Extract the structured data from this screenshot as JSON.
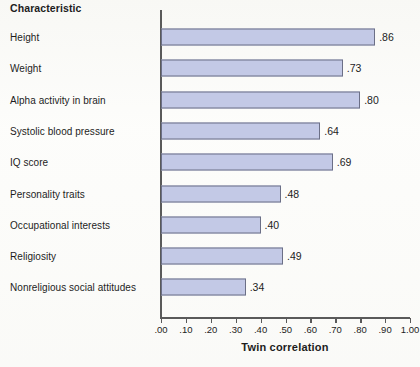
{
  "header": {
    "characteristic_label": "Characteristic"
  },
  "axis": {
    "x_title": "Twin correlation",
    "ticks": [
      ".00",
      ".10",
      ".20",
      ".30",
      ".40",
      ".50",
      ".60",
      ".70",
      ".80",
      ".90",
      "1.00"
    ]
  },
  "colors": {
    "bar_fill": "#c3c9e6",
    "bar_stroke": "#6b6f86",
    "axis": "#5a5a5a",
    "text": "#1d1d1d",
    "background": "#fdfdfb"
  },
  "chart_data": {
    "type": "bar",
    "orientation": "horizontal",
    "title": "",
    "xlabel": "Twin correlation",
    "ylabel": "Characteristic",
    "xlim": [
      0.0,
      1.0
    ],
    "xticks": [
      0.0,
      0.1,
      0.2,
      0.3,
      0.4,
      0.5,
      0.6,
      0.7,
      0.8,
      0.9,
      1.0
    ],
    "grid": false,
    "legend": false,
    "categories": [
      "Height",
      "Weight",
      "Alpha activity in brain",
      "Systolic blood pressure",
      "IQ score",
      "Personality traits",
      "Occupational interests",
      "Religiosity",
      "Nonreligious social attitudes"
    ],
    "values": [
      0.86,
      0.73,
      0.8,
      0.64,
      0.69,
      0.48,
      0.4,
      0.49,
      0.34
    ],
    "value_labels": [
      ".86",
      ".73",
      ".80",
      ".64",
      ".69",
      ".48",
      ".40",
      ".49",
      ".34"
    ]
  }
}
